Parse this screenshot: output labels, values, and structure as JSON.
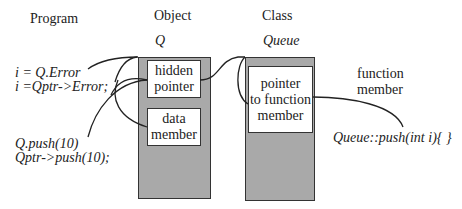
{
  "headers": {
    "program": "Program",
    "object": "Object",
    "class": "Class"
  },
  "object": {
    "name": "Q",
    "members": {
      "hidden_pointer": [
        "hidden",
        "pointer"
      ],
      "data_member": [
        "data",
        "member"
      ]
    }
  },
  "class": {
    "name": "Queue",
    "members": {
      "pointer_to_function": [
        "pointer",
        "to function",
        "member"
      ]
    }
  },
  "program_code": {
    "line1": "i = Q.Error",
    "line2": "i =Qptr->Error;",
    "line3": "Q.push(10)",
    "line4": "Qptr->push(10);"
  },
  "function_member": {
    "label": [
      "function",
      "member"
    ],
    "code": "Queue::push(int i){ }"
  },
  "colors": {
    "box_fill": "#a9a9a9",
    "line": "#222222"
  }
}
